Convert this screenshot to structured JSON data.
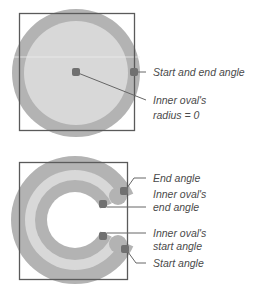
{
  "colors": {
    "outer_ring": "#b3b3b3",
    "inner_fill": "#d8d8d8",
    "handle": "#707070",
    "frame": "#5a5a5a",
    "leader": "#666666",
    "text": "#4a4a4a"
  },
  "top_diagram": {
    "labels": {
      "start_end": "Start and end angle",
      "inner_radius_line1": "Inner oval's",
      "inner_radius_line2": "radius = 0"
    }
  },
  "bottom_diagram": {
    "labels": {
      "end_angle": "End angle",
      "inner_end_line1": "Inner oval's",
      "inner_end_line2": "end angle",
      "inner_start_line1": "Inner oval's",
      "inner_start_line2": "start angle",
      "start_angle": "Start angle"
    }
  }
}
